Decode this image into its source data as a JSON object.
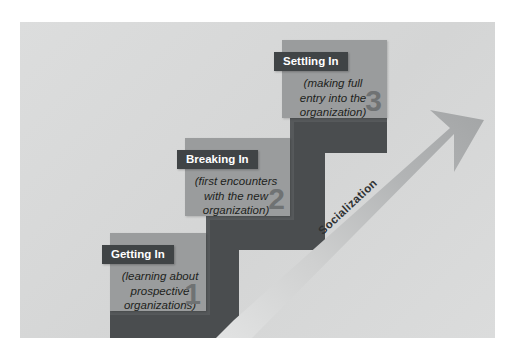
{
  "figure": {
    "arrow": {
      "label": "Socialization",
      "direction": "upward-right"
    },
    "colors": {
      "canvas_background": "#d9dada",
      "stairs_dark": "#4a4d4f",
      "panel_fill": "#9a9c9d",
      "panel_title_bar": "#404446",
      "panel_title_text": "#ffffff",
      "panel_body_text": "#1d1f20",
      "numeral": "#6f7273",
      "arrow_light": "#d2d3d3",
      "arrow_mid": "#a8aaab"
    },
    "steps": [
      {
        "number": "1",
        "title": "Getting In",
        "description": "(learning about\nprospective\norganizations)"
      },
      {
        "number": "2",
        "title": "Breaking In",
        "description": "(first encounters\nwith the new\norganization)"
      },
      {
        "number": "3",
        "title": "Settling In",
        "description": "(making full\nentry into the\norganization)"
      }
    ]
  }
}
